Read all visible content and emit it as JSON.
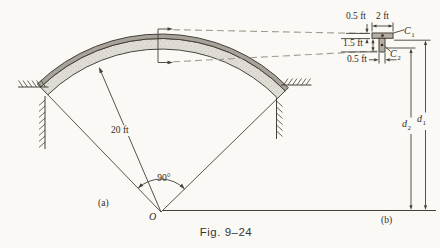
{
  "figure": {
    "caption": "Fig. 9–24",
    "panel_a_label": "(a)",
    "panel_b_label": "(b)"
  },
  "arch": {
    "radius_label": "20 ft",
    "angle_label": "90°",
    "center_label": "O"
  },
  "section": {
    "flange_width": "2 ft",
    "flange_thickness": "0.5 ft",
    "stem_height": "1.5 ft",
    "stem_width": "0.5 ft",
    "centroid1": {
      "base": "C",
      "sub": "1"
    },
    "centroid2": {
      "base": "C",
      "sub": "2"
    },
    "dist1": {
      "base": "d",
      "sub": "1"
    },
    "dist2": {
      "base": "d",
      "sub": "2"
    }
  },
  "colors": {
    "bg": "#fbf9f5",
    "line": "#44403a",
    "dash": "#a19b90",
    "band": "#a8a39a",
    "inner": "#e0ddd6",
    "stipple": "#b3aea4",
    "section": "#b7afa3",
    "text": "#2f2b26"
  }
}
